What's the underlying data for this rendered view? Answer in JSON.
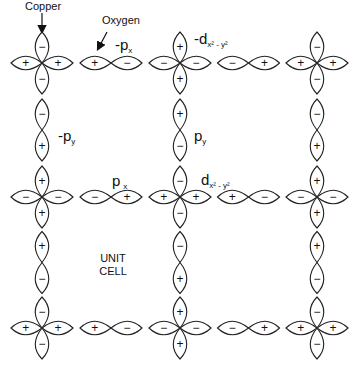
{
  "diagram": {
    "labels": {
      "copper": "Copper",
      "oxygen": "Oxygen",
      "unit_cell_line1": "UNIT",
      "unit_cell_line2": "CELL",
      "neg_px": {
        "main": "-p",
        "sub": "x"
      },
      "neg_dx2y2": {
        "main": "-d",
        "sub": "x² - y²"
      },
      "neg_py": {
        "main": "-p",
        "sub": "y"
      },
      "py": {
        "main": "p",
        "sub": "y"
      },
      "px": {
        "main": "p",
        "sub": "x"
      },
      "dx2y2": {
        "main": "d",
        "sub": "x² - y²"
      }
    },
    "copper_x": [
      42,
      180,
      317
    ],
    "copper_y": [
      63,
      197,
      328
    ],
    "lobe_length": 31,
    "lobe_halfwidth": 10,
    "copper_sites": [
      {
        "row": 0,
        "col": 0,
        "top": "-",
        "bottom": "-",
        "left": "+",
        "right": "+"
      },
      {
        "row": 0,
        "col": 1,
        "top": "+",
        "bottom": "+",
        "left": "-",
        "right": "-"
      },
      {
        "row": 0,
        "col": 2,
        "top": "-",
        "bottom": "-",
        "left": "+",
        "right": "+"
      },
      {
        "row": 1,
        "col": 0,
        "top": "+",
        "bottom": "+",
        "left": "-",
        "right": "-"
      },
      {
        "row": 1,
        "col": 1,
        "top": "-",
        "bottom": "-",
        "left": "+",
        "right": "+"
      },
      {
        "row": 1,
        "col": 2,
        "top": "+",
        "bottom": "+",
        "left": "-",
        "right": "-"
      },
      {
        "row": 2,
        "col": 0,
        "top": "-",
        "bottom": "-",
        "left": "+",
        "right": "+"
      },
      {
        "row": 2,
        "col": 1,
        "top": "+",
        "bottom": "+",
        "left": "-",
        "right": "-"
      },
      {
        "row": 2,
        "col": 2,
        "top": "-",
        "bottom": "-",
        "left": "+",
        "right": "+"
      }
    ],
    "oxygen_horizontal": [
      {
        "row": 0,
        "between": [
          0,
          1
        ],
        "left": "+",
        "right": "-"
      },
      {
        "row": 0,
        "between": [
          1,
          2
        ],
        "left": "-",
        "right": "+"
      },
      {
        "row": 1,
        "between": [
          0,
          1
        ],
        "left": "-",
        "right": "+"
      },
      {
        "row": 1,
        "between": [
          1,
          2
        ],
        "left": "+",
        "right": "-"
      },
      {
        "row": 2,
        "between": [
          0,
          1
        ],
        "left": "+",
        "right": "-"
      },
      {
        "row": 2,
        "between": [
          1,
          2
        ],
        "left": "-",
        "right": "+"
      }
    ],
    "oxygen_vertical": [
      {
        "col": 0,
        "between": [
          0,
          1
        ],
        "top": "-",
        "bottom": "+"
      },
      {
        "col": 1,
        "between": [
          0,
          1
        ],
        "top": "+",
        "bottom": "-"
      },
      {
        "col": 2,
        "between": [
          0,
          1
        ],
        "top": "-",
        "bottom": "+"
      },
      {
        "col": 0,
        "between": [
          1,
          2
        ],
        "top": "+",
        "bottom": "-"
      },
      {
        "col": 1,
        "between": [
          1,
          2
        ],
        "top": "-",
        "bottom": "+"
      },
      {
        "col": 2,
        "between": [
          1,
          2
        ],
        "top": "+",
        "bottom": "-"
      }
    ],
    "colors": {
      "stroke": "#222222",
      "text": "#111111",
      "background": "#ffffff"
    }
  }
}
